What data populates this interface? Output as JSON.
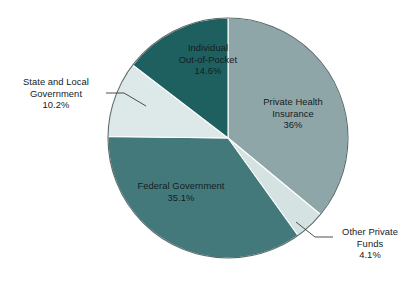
{
  "chart_data": {
    "type": "pie",
    "title": "",
    "subtitle": "",
    "xlabel": "",
    "ylabel": "",
    "legend_position": "none",
    "grid": false,
    "labels_on_slices": true,
    "start_angle_deg": 0,
    "direction": "clockwise",
    "categories": [
      "Private Health Insurance",
      "Other Private Funds",
      "Federal Government",
      "State and Local Government",
      "Individual Out-of-Pocket"
    ],
    "values": [
      36,
      4.1,
      35.1,
      10.2,
      14.6
    ],
    "value_labels": [
      "36%",
      "4.1%",
      "35.1%",
      "10.2%",
      "14.6%"
    ],
    "colors": [
      "#8fa6a8",
      "#d4e2e2",
      "#44797c",
      "#dde8e8",
      "#1e5f60"
    ],
    "slices": [
      {
        "name": "Private Health Insurance",
        "name_line1": "Private Health",
        "name_line2": "Insurance",
        "value": 36,
        "value_label": "36%",
        "color": "#8fa6a8",
        "label_placement": "inside"
      },
      {
        "name": "Other Private Funds",
        "name_line1": "Other Private",
        "name_line2": "Funds",
        "value": 4.1,
        "value_label": "4.1%",
        "color": "#d4e2e2",
        "label_placement": "outside-right"
      },
      {
        "name": "Federal Government",
        "name_line1": "Federal Government",
        "name_line2": "",
        "value": 35.1,
        "value_label": "35.1%",
        "color": "#44797c",
        "label_placement": "inside"
      },
      {
        "name": "State and Local Government",
        "name_line1": "State and Local",
        "name_line2": "Government",
        "value": 10.2,
        "value_label": "10.2%",
        "color": "#dde8e8",
        "label_placement": "outside-left"
      },
      {
        "name": "Individual Out-of-Pocket",
        "name_line1": "Individual",
        "name_line2": "Out-of-Pocket",
        "value": 14.6,
        "value_label": "14.6%",
        "color": "#1e5f60",
        "label_placement": "inside"
      }
    ]
  },
  "geometry": {
    "center_x": 228,
    "center_y": 138,
    "radius": 120
  }
}
